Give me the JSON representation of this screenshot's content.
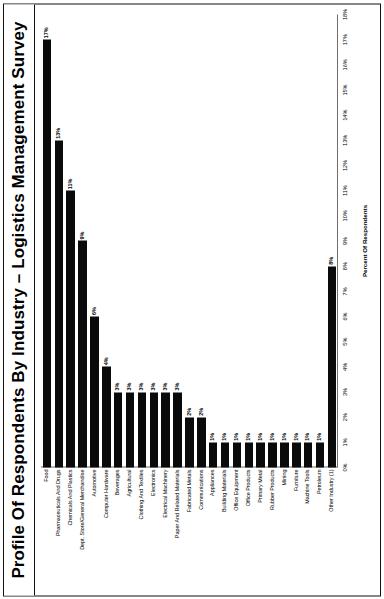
{
  "chart_data": {
    "type": "bar",
    "title": "Profile Of Respondents By Industry – Logistics Management Survey",
    "orientation": "vertical-bars",
    "xlabel": "",
    "ylabel": "Percent Of Respondents",
    "ylim": [
      0,
      18
    ],
    "grid": false,
    "legend": null,
    "tick_labels": [
      "0%",
      "1%",
      "2%",
      "3%",
      "4%",
      "5%",
      "6%",
      "7%",
      "8%",
      "9%",
      "10%",
      "11%",
      "12%",
      "13%",
      "14%",
      "15%",
      "16%",
      "17%",
      "18%"
    ],
    "tick_values": [
      0,
      1,
      2,
      3,
      4,
      5,
      6,
      7,
      8,
      9,
      10,
      11,
      12,
      13,
      14,
      15,
      16,
      17,
      18
    ],
    "categories": [
      "Food",
      "Pharmaceuticals And Drugs",
      "Chemicals And Plastics",
      "Dept. Store/General Merchandise",
      "Automotive",
      "Computer Hardware",
      "Beverages",
      "Agricultural",
      "Clothing And Textiles",
      "Electronics",
      "Electrical Machinery",
      "Paper And Related Materials",
      "Fabricated Metals",
      "Communications",
      "Appliances",
      "Building Materials",
      "Office Equipment",
      "Office Products",
      "Primary Metal",
      "Rubber Products",
      "Mining",
      "Furniture",
      "Machine Tools",
      "Petroleum",
      "Other Industry (1)"
    ],
    "values": [
      17,
      13,
      11,
      9,
      6,
      4,
      3,
      3,
      3,
      3,
      3,
      3,
      2,
      2,
      1,
      1,
      1,
      1,
      1,
      1,
      1,
      1,
      1,
      1,
      8
    ],
    "value_labels": [
      "17%",
      "13%",
      "11%",
      "9%",
      "6%",
      "4%",
      "3%",
      "3%",
      "3%",
      "3%",
      "3%",
      "3%",
      "2%",
      "2%",
      "1%",
      "1%",
      "1%",
      "1%",
      "1%",
      "1%",
      "1%",
      "1%",
      "1%",
      "1%",
      "8%"
    ],
    "bar_color": "#0a0a0a",
    "axis_color": "#6f6f6f",
    "background": "#ffffff"
  },
  "footnote": "Note: (1) \"Other Industry\" as defined by survey respondents."
}
